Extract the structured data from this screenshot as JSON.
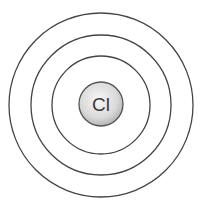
{
  "diagram": {
    "nucleus": {
      "symbol": "Cl",
      "fill_light": "#f4f4f4",
      "fill_dark": "#b8b8b8",
      "stroke": "#555555"
    },
    "shells": [
      {
        "name": "shell-1",
        "radius": 49
      },
      {
        "name": "shell-2",
        "radius": 70
      },
      {
        "name": "shell-3",
        "radius": 92
      }
    ],
    "stroke_color": "#444444"
  }
}
